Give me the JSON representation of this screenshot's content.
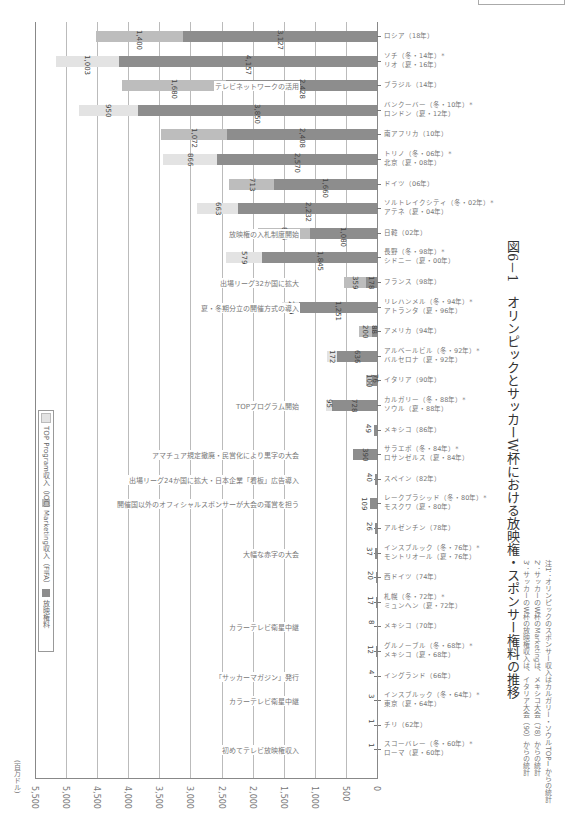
{
  "chart_data": {
    "type": "bar",
    "orientation": "rotated-90-horizontal-stacked",
    "title": "図6－1　オリンピックとサッカーW杯における放映権・スポンサー権料の推移",
    "ylabel": "(百万ドル)",
    "ylim": [
      0,
      5500
    ],
    "ticks": [
      "0",
      "500",
      "1,000",
      "1,500",
      "2,000",
      "2,500",
      "3,000",
      "3,500",
      "4,000",
      "4,500",
      "5,000",
      "5,500"
    ],
    "legend": [
      "放映権料",
      "Marketing収入（FIFA）",
      "TOP Program収入（IOC）"
    ],
    "categories": [
      "ロシア（18年）",
      "ソチ（冬・14年）*リオ（夏・16年）",
      "ブラジル（14年）",
      "バンクーバー（冬・10年）*ロンドン（夏・12年）",
      "南アフリカ（10年）",
      "トリノ（冬・06年）*北京（夏・08年）",
      "ドイツ（06年）",
      "ソルトレイクシティ（冬・02年）*アテネ（夏・04年）",
      "日韓（02年）",
      "長野（冬・98年）*シドニー（夏・00年）",
      "フランス（98年）",
      "リレハンメル（冬・94年）*アトランタ（夏・96年）",
      "アメリカ（94年）",
      "アルベールビル（冬・92年）*バルセロナ（夏・92年）",
      "イタリア（90年）",
      "カルガリー（冬・88年）*ソウル（夏・88年）",
      "メキシコ（86年）",
      "サラエボ（冬・84年）*ロサンゼルス（夏・84年）",
      "スペイン（82年）",
      "レークプラシッド（冬・80年）*モスクワ（夏・80年）",
      "アルゼンチン（78年）",
      "インスブルック（冬・76年）*モントリオール（夏・76年）",
      "西ドイツ（74年）",
      "札幌（冬・72年）*ミュンヘン（夏・72年）",
      "メキシコ（70年）",
      "グルノーブル（冬・68年）*メキシコ（夏・68年）",
      "イングランド（66年）",
      "インスブルック（冬・64年）*東京（夏・64年）",
      "チリ（62年）",
      "スコーバレー（冬・60年）*ローマ（夏・60年）"
    ],
    "series": [
      {
        "name": "放映権料",
        "values": [
          3127,
          4157,
          2428,
          3850,
          2408,
          2570,
          1660,
          2232,
          1080,
          1845,
          178,
          1251,
          88,
          636,
          76,
          728,
          49,
          390,
          40,
          109,
          26,
          37,
          20,
          17,
          8,
          12,
          4,
          3,
          1,
          1
        ]
      },
      {
        "name": "Marketing収入（FIFA）",
        "values": [
          1400,
          0,
          1680,
          0,
          1072,
          0,
          713,
          0,
          834,
          0,
          359,
          0,
          200,
          0,
          100,
          0,
          0,
          0,
          0,
          0,
          0,
          0,
          0,
          0,
          0,
          0,
          0,
          0,
          0,
          0
        ]
      },
      {
        "name": "TOP Program収入（IOC）",
        "values": [
          0,
          1003,
          0,
          950,
          0,
          866,
          0,
          663,
          0,
          579,
          0,
          279,
          0,
          172,
          0,
          95,
          0,
          0,
          0,
          0,
          0,
          0,
          0,
          0,
          0,
          0,
          0,
          0,
          0,
          0
        ]
      }
    ],
    "value_labels": [
      [
        "3,127",
        "1,400",
        ""
      ],
      [
        "4,157",
        "",
        "1,003"
      ],
      [
        "2,428",
        "1,680",
        ""
      ],
      [
        "3,850",
        "",
        "950"
      ],
      [
        "2,408",
        "1,072",
        ""
      ],
      [
        "2,570",
        "",
        "866"
      ],
      [
        "1,660",
        "713",
        ""
      ],
      [
        "2,232",
        "",
        "663"
      ],
      [
        "1,080",
        "834",
        ""
      ],
      [
        "1,845",
        "",
        "579"
      ],
      [
        "178",
        "359",
        ""
      ],
      [
        "1,251",
        "",
        "279"
      ],
      [
        "88",
        "200",
        ""
      ],
      [
        "636",
        "",
        "172"
      ],
      [
        "76",
        "100",
        ""
      ],
      [
        "728",
        "",
        "95"
      ],
      [
        "49",
        "",
        ""
      ],
      [
        "390",
        "",
        ""
      ],
      [
        "40",
        "",
        ""
      ],
      [
        "109",
        "",
        ""
      ],
      [
        "26",
        "",
        ""
      ],
      [
        "37",
        "",
        ""
      ],
      [
        "20",
        "",
        ""
      ],
      [
        "17",
        "",
        ""
      ],
      [
        "8",
        "",
        ""
      ],
      [
        "12",
        "",
        ""
      ],
      [
        "4",
        "",
        ""
      ],
      [
        "3",
        "",
        ""
      ],
      [
        "1",
        "",
        ""
      ],
      [
        "1",
        "",
        ""
      ]
    ],
    "annotations": [
      {
        "text": "テレビネットワークの活用",
        "row": 2
      },
      {
        "text": "放映権の入札制度開始",
        "row": 8
      },
      {
        "text": "出場リーグ32か国に拡大",
        "row": 10
      },
      {
        "text": "夏・冬期分立の開催方式の導入",
        "row": 11
      },
      {
        "text": "TOPプログラム開始",
        "row": 15
      },
      {
        "text": "アマチュア規定撤廃・民営化により黒字の大会",
        "row": 17
      },
      {
        "text": "出場リーグ24か国に拡大・日本企業「看板」広告導入",
        "row": 18
      },
      {
        "text": "開催国以外のオフィシャルスポンサーが大会の運営を担う",
        "row": 19
      },
      {
        "text": "大幅な赤字の大会",
        "row": 21
      },
      {
        "text": "カラーテレビ衛星中継",
        "row": 24
      },
      {
        "text": "「サッカーマガジン」発行",
        "row": 26
      },
      {
        "text": "カラーテレビ衛星中継",
        "row": 27
      },
      {
        "text": "初めてテレビ放映権収入",
        "row": 29
      }
    ]
  },
  "header": {
    "title": "図6－1　オリンピックとサッカーW杯における放映権・スポンサー権料の推移"
  },
  "axis": {
    "unit": "(百万ドル)",
    "ticks": [
      "0",
      "500",
      "1,000",
      "1,500",
      "2,000",
      "2,500",
      "3,000",
      "3,500",
      "4,000",
      "4,500",
      "5,000",
      "5,500"
    ]
  },
  "legend": {
    "items": [
      {
        "label": "放映権料",
        "color": "#8d8d8d"
      },
      {
        "label": "Marketing収入（FIFA）",
        "color": "#bdbdbd"
      },
      {
        "label": "TOP Program収入（IOC）",
        "color": "#e3e3e3"
      }
    ]
  },
  "notes": {
    "line1": "注1：オリンピックのスポンサー収入はカルガリー・ソウルTOPⅠからの統計",
    "line2": "2：サッカーのW杯のMarketingは、メキシコ大会（78）からの統計",
    "line3": "3：サッカーのW杯の放映権収入は、イタリア大会（90）からの統計"
  }
}
